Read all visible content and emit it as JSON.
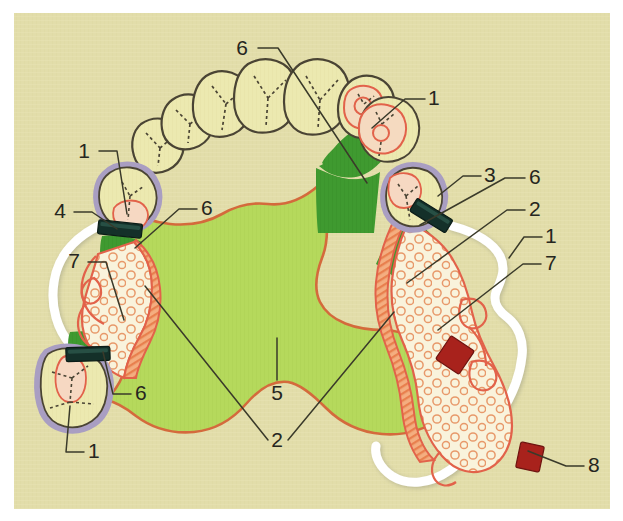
{
  "figure": {
    "background_color": "#e2ddaa",
    "margin_color": "#ffffff",
    "outline_color": "#3a3a30"
  },
  "palette": {
    "background": "#e2ddaa",
    "tooth_fill": "#ece9b0",
    "tooth_outline": "#4a4434",
    "crown_ring": "#a99ec2",
    "crown_inner_fill": "#f6d8c2",
    "crown_inner_outline": "#e2624a",
    "dark_green": "#3f9a30",
    "light_green": "#b5d95c",
    "orange_hatch": "#f0a070",
    "orange_line": "#e2624a",
    "cream_mesh": "#f7f0d8",
    "mesh_circle": "#e89a6a",
    "clasp_dark": "#143029",
    "clasp_red": "#a8221c",
    "denture_white": "#ffffff",
    "leader_line": "#3a3a2a",
    "label_text": "#262620"
  },
  "legend_keys": [
    {
      "key": "1",
      "meaning": "crowned abutment tooth"
    },
    {
      "key": "2",
      "meaning": "major connector border / saddle junction"
    },
    {
      "key": "3",
      "meaning": "full crown restoration"
    },
    {
      "key": "4",
      "meaning": "occlusal rest / clasp arm"
    },
    {
      "key": "5",
      "meaning": "palatal plate (major connector)"
    },
    {
      "key": "6",
      "meaning": "dark green relief / guide plane zone"
    },
    {
      "key": "7",
      "meaning": "denture base mesh / saddle area"
    },
    {
      "key": "8",
      "meaning": "retention element / red marker"
    }
  ],
  "labels": [
    {
      "id": "label-6-top",
      "text": "6",
      "x": 248,
      "y": 55,
      "anchor": "end",
      "leader": [
        [
          258,
          48
        ],
        [
          278,
          48
        ],
        [
          367,
          183
        ]
      ]
    },
    {
      "id": "label-1-right-upper",
      "text": "1",
      "x": 428,
      "y": 105,
      "anchor": "start",
      "leader": [
        [
          425,
          99
        ],
        [
          405,
          99
        ],
        [
          372,
          128
        ]
      ]
    },
    {
      "id": "label-1-left-upper",
      "text": "1",
      "x": 90,
      "y": 158,
      "anchor": "end",
      "leader": [
        [
          99,
          151
        ],
        [
          117,
          151
        ],
        [
          127,
          214
        ]
      ]
    },
    {
      "id": "label-3-right",
      "text": "3",
      "x": 484,
      "y": 182,
      "anchor": "start",
      "leader": [
        [
          481,
          176
        ],
        [
          463,
          176
        ],
        [
          438,
          196
        ]
      ]
    },
    {
      "id": "label-6-right",
      "text": "6",
      "x": 529,
      "y": 184,
      "anchor": "start",
      "leader": [
        [
          525,
          178
        ],
        [
          505,
          178
        ],
        [
          420,
          225
        ]
      ]
    },
    {
      "id": "label-4-left",
      "text": "4",
      "x": 66,
      "y": 218,
      "anchor": "end",
      "leader": [
        [
          74,
          212
        ],
        [
          92,
          212
        ],
        [
          117,
          229
        ]
      ]
    },
    {
      "id": "label-6-left",
      "text": "6",
      "x": 201,
      "y": 215,
      "anchor": "start",
      "leader": [
        [
          197,
          209
        ],
        [
          179,
          209
        ],
        [
          135,
          248
        ]
      ]
    },
    {
      "id": "label-2-right",
      "text": "2",
      "x": 529,
      "y": 216,
      "anchor": "start",
      "leader": [
        [
          525,
          210
        ],
        [
          507,
          210
        ],
        [
          407,
          283
        ]
      ]
    },
    {
      "id": "label-1-far-right",
      "text": "1",
      "x": 545,
      "y": 243,
      "anchor": "start",
      "leader": [
        [
          542,
          237
        ],
        [
          524,
          237
        ],
        [
          509,
          258
        ]
      ]
    },
    {
      "id": "label-7-left",
      "text": "7",
      "x": 80,
      "y": 268,
      "anchor": "end",
      "leader": [
        [
          88,
          262
        ],
        [
          106,
          262
        ],
        [
          124,
          320
        ]
      ]
    },
    {
      "id": "label-7-right",
      "text": "7",
      "x": 545,
      "y": 270,
      "anchor": "start",
      "leader": [
        [
          541,
          264
        ],
        [
          523,
          264
        ],
        [
          438,
          330
        ]
      ]
    },
    {
      "id": "label-6-lower-left",
      "text": "6",
      "x": 135,
      "y": 400,
      "anchor": "start",
      "leader": [
        [
          131,
          394
        ],
        [
          113,
          394
        ],
        [
          103,
          352
        ]
      ]
    },
    {
      "id": "label-5-center",
      "text": "5",
      "x": 277,
      "y": 400,
      "anchor": "middle",
      "leader": [
        [
          277,
          380
        ],
        [
          277,
          338
        ]
      ]
    },
    {
      "id": "label-2-center",
      "text": "2",
      "x": 277,
      "y": 447,
      "anchor": "middle",
      "leader": [
        [
          268,
          440
        ],
        [
          145,
          286
        ]
      ]
    },
    {
      "id": "label-2-center-b",
      "text": "2",
      "x": 277,
      "y": 447,
      "anchor": "middle",
      "leader": [
        [
          288,
          440
        ],
        [
          394,
          312
        ]
      ]
    },
    {
      "id": "label-1-lower-left",
      "text": "1",
      "x": 88,
      "y": 458,
      "anchor": "start",
      "leader": [
        [
          84,
          452
        ],
        [
          66,
          452
        ],
        [
          70,
          406
        ]
      ]
    },
    {
      "id": "label-8-right",
      "text": "8",
      "x": 588,
      "y": 472,
      "anchor": "start",
      "leader": [
        [
          584,
          466
        ],
        [
          566,
          466
        ],
        [
          528,
          451
        ]
      ]
    }
  ],
  "teeth_anterior": [
    {
      "name": "left-second-premolar",
      "cx": 158,
      "cy": 145
    },
    {
      "name": "left-first-premolar",
      "cx": 189,
      "cy": 117
    },
    {
      "name": "left-canine",
      "cx": 228,
      "cy": 95
    },
    {
      "name": "left-central-incisor",
      "cx": 272,
      "cy": 85
    },
    {
      "name": "right-central-incisor",
      "cx": 320,
      "cy": 86
    },
    {
      "name": "right-canine",
      "cx": 368,
      "cy": 108
    }
  ],
  "crowned_teeth": [
    {
      "name": "upper-left-crown-molar",
      "cx": 127,
      "cy": 196
    },
    {
      "name": "lower-left-crown-molar",
      "cx": 77,
      "cy": 385
    },
    {
      "name": "right-crown-premolar",
      "cx": 415,
      "cy": 197
    }
  ],
  "clasps": [
    {
      "name": "clasp-left-upper",
      "x": 98,
      "y": 222,
      "w": 44,
      "h": 14,
      "rot": 6,
      "color": "#143029"
    },
    {
      "name": "clasp-left-lower",
      "x": 66,
      "y": 347,
      "w": 44,
      "h": 14,
      "rot": -2,
      "color": "#143029"
    },
    {
      "name": "clasp-right",
      "x": 410,
      "y": 208,
      "w": 42,
      "h": 15,
      "rot": 32,
      "color": "#143029"
    },
    {
      "name": "retainer-red-upper",
      "x": 441,
      "y": 341,
      "w": 28,
      "h": 28,
      "rot": 34,
      "color": "#a8221c"
    },
    {
      "name": "retainer-red-lower",
      "x": 518,
      "y": 444,
      "w": 24,
      "h": 26,
      "rot": 12,
      "color": "#a8221c"
    }
  ]
}
